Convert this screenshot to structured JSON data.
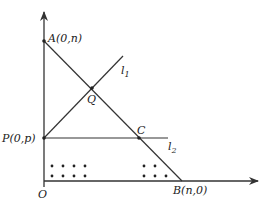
{
  "diagram": {
    "type": "coordinate-geometry",
    "axes": {
      "origin_label": "O",
      "x_axis": "horizontal arrow",
      "y_axis": "vertical arrow"
    },
    "points": {
      "A": {
        "label": "A(0,n)"
      },
      "B": {
        "label": "B(n,0)"
      },
      "P": {
        "label": "P(0,p)"
      },
      "Q": {
        "label": "Q"
      },
      "C": {
        "label": "C"
      },
      "O": {
        "label": "O"
      }
    },
    "lines": {
      "l1": {
        "name": "l",
        "sub": "1"
      },
      "l2": {
        "name": "l",
        "sub": "2"
      },
      "AB": {
        "label": "segment AB"
      }
    },
    "lattice_dots": {
      "left_group": 8,
      "right_group": 5
    },
    "colors": {
      "line": "#333333",
      "text": "#222222",
      "background": "#ffffff"
    }
  }
}
